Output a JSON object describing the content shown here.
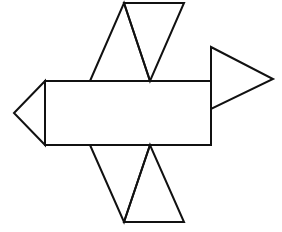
{
  "diagram": {
    "title": "",
    "colors": {
      "stroke": "#111111",
      "background": "#ffffff"
    },
    "faces": [
      {
        "name": "rectangle-face",
        "shape": "rectangle"
      },
      {
        "name": "left-triangle-face",
        "shape": "triangle"
      },
      {
        "name": "right-triangle-face",
        "shape": "triangle"
      },
      {
        "name": "top-left-triangle-face",
        "shape": "triangle"
      },
      {
        "name": "top-right-triangle-face",
        "shape": "triangle"
      },
      {
        "name": "bottom-left-triangle-face",
        "shape": "triangle"
      },
      {
        "name": "bottom-right-triangle-face",
        "shape": "triangle"
      }
    ]
  }
}
